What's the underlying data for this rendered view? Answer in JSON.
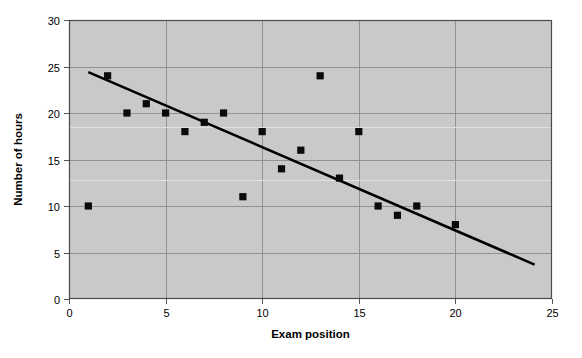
{
  "chart_data": {
    "type": "scatter",
    "title": "",
    "xlabel": "Exam position",
    "ylabel": "Number of hours",
    "xlim": [
      0,
      25
    ],
    "ylim": [
      0,
      30
    ],
    "xticks": [
      0,
      5,
      10,
      15,
      20,
      25
    ],
    "yticks": [
      0,
      5,
      10,
      15,
      20,
      25,
      30
    ],
    "xtick_labels": [
      "0",
      "5",
      "10",
      "15",
      "20",
      "25"
    ],
    "ytick_labels": [
      "0",
      "5",
      "10",
      "15",
      "20",
      "25",
      "30"
    ],
    "grid": true,
    "legend": "none",
    "plot_background": "#c9c9c9",
    "marker_color": "#0a0a0a",
    "marker_shape": "square",
    "points": [
      {
        "x": 1,
        "y": 10
      },
      {
        "x": 2,
        "y": 24
      },
      {
        "x": 3,
        "y": 20
      },
      {
        "x": 4,
        "y": 21
      },
      {
        "x": 5,
        "y": 20
      },
      {
        "x": 6,
        "y": 18
      },
      {
        "x": 7,
        "y": 19
      },
      {
        "x": 8,
        "y": 20
      },
      {
        "x": 9,
        "y": 11
      },
      {
        "x": 10,
        "y": 18
      },
      {
        "x": 11,
        "y": 14
      },
      {
        "x": 12,
        "y": 16
      },
      {
        "x": 13,
        "y": 24
      },
      {
        "x": 14,
        "y": 13
      },
      {
        "x": 15,
        "y": 18
      },
      {
        "x": 16,
        "y": 10
      },
      {
        "x": 17,
        "y": 9
      },
      {
        "x": 18,
        "y": 10
      },
      {
        "x": 20,
        "y": 8
      }
    ],
    "trendline": {
      "type": "linear-fit",
      "x_start": 1.0,
      "y_start": 24.4,
      "x_end": 24.1,
      "y_end": 3.7,
      "color": "#000000"
    }
  }
}
